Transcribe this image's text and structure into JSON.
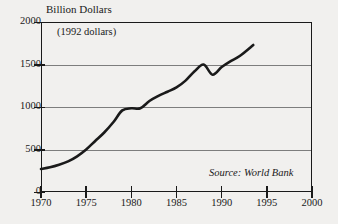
{
  "chart_data": {
    "type": "line",
    "title": "Billion Dollars",
    "subtitle": "(1992 dollars)",
    "xlabel": "",
    "ylabel": "Billion Dollars",
    "units_note": "(1992 dollars)",
    "source": "Source: World Bank",
    "xlim": [
      1970,
      2000
    ],
    "ylim": [
      0,
      2000
    ],
    "grid": true,
    "legend": "none",
    "x_ticks": [
      1970,
      1975,
      1980,
      1985,
      1990,
      1995,
      2000
    ],
    "x_tick_labels": [
      "1970",
      "1975",
      "1980",
      "1985",
      "1990",
      "1995",
      "2000"
    ],
    "y_ticks": [
      0,
      500,
      1000,
      1500,
      2000
    ],
    "y_tick_labels": [
      "0",
      "500",
      "1000",
      "1500",
      "2000"
    ],
    "series": [
      {
        "name": "Total external debt",
        "color": "#1a1a1a",
        "x": [
          1970,
          1971,
          1972,
          1973,
          1974,
          1975,
          1976,
          1977,
          1978,
          1979,
          1980,
          1981,
          1982,
          1983,
          1984,
          1985,
          1986,
          1987,
          1988,
          1989,
          1990,
          1991,
          1992,
          1993.5
        ],
        "values": [
          270,
          290,
          320,
          360,
          420,
          500,
          600,
          700,
          820,
          960,
          985,
          985,
          1070,
          1130,
          1180,
          1230,
          1310,
          1420,
          1500,
          1380,
          1470,
          1540,
          1600,
          1730
        ]
      }
    ]
  }
}
